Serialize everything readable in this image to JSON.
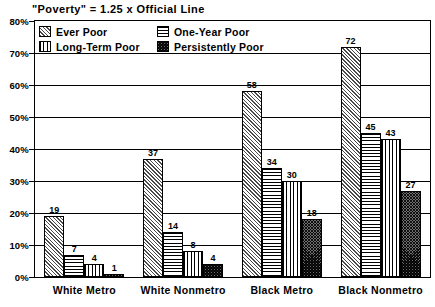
{
  "chart_data": {
    "type": "bar",
    "title": "\"Poverty\" = 1.25 x Official Line",
    "xlabel": "",
    "ylabel": "",
    "ylim": [
      0,
      80
    ],
    "ytick_labels": [
      "0%",
      "10%",
      "20%",
      "30%",
      "40%",
      "50%",
      "60%",
      "70%",
      "80%"
    ],
    "ytick_values": [
      0,
      10,
      20,
      30,
      40,
      50,
      60,
      70,
      80
    ],
    "grid": true,
    "legend_position": "top-left-inside",
    "categories": [
      "White Metro",
      "White Nonmetro",
      "Black Metro",
      "Black Nonmetro"
    ],
    "series": [
      {
        "name": "Ever Poor",
        "pattern": "diagonal-hatch",
        "values": [
          19,
          37,
          58,
          72
        ]
      },
      {
        "name": "Long-Term Poor",
        "pattern": "horizontal-lines",
        "values": [
          7,
          14,
          34,
          45
        ]
      },
      {
        "name": "One-Year Poor",
        "pattern": "vertical-lines",
        "values": [
          4,
          8,
          30,
          43
        ]
      },
      {
        "name": "Persistently Poor",
        "pattern": "dense-crosshatch",
        "values": [
          1,
          4,
          18,
          27
        ]
      }
    ],
    "legend_order": [
      "Ever Poor",
      "One-Year Poor",
      "Long-Term Poor",
      "Persistently Poor"
    ]
  }
}
